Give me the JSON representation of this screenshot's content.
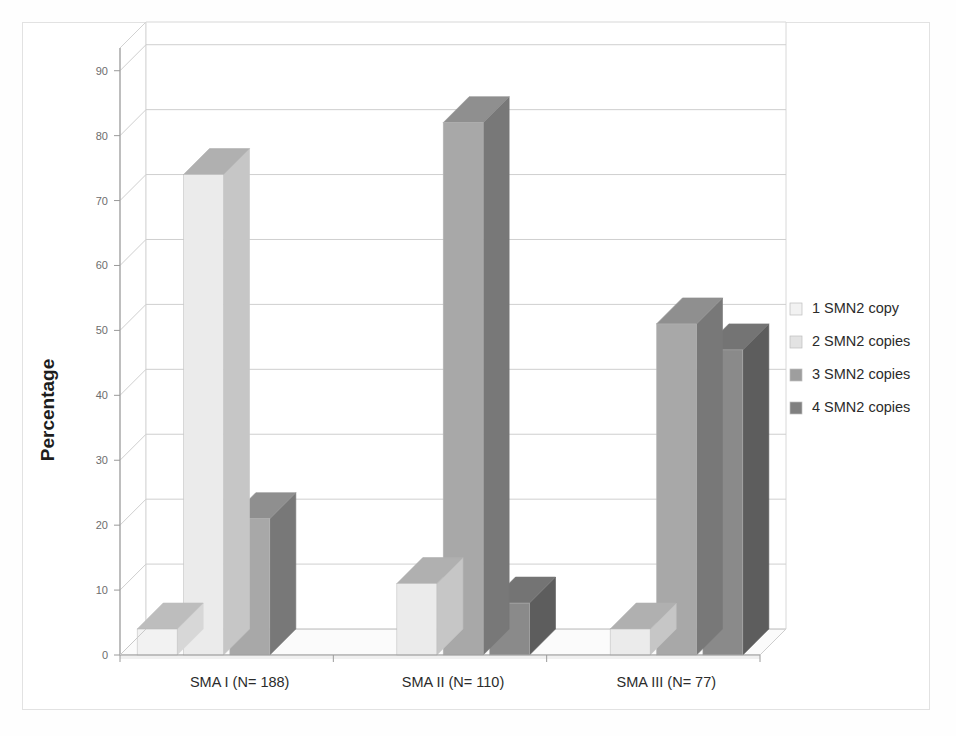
{
  "figure": {
    "background_color": "#ffffff",
    "frame_color": "#e2e2e2",
    "plot_background_color": "#ffffff"
  },
  "chart_data": {
    "type": "bar",
    "subtype": "grouped-3d-column",
    "title": "",
    "subtitle": "",
    "xlabel": "",
    "ylabel": "Percentage",
    "categories": [
      "SMA I (N= 188)",
      "SMA II (N= 110)",
      "SMA III (N= 77)"
    ],
    "series": [
      {
        "name": "1 SMN2 copy",
        "color": "#f2f2f2",
        "side_color": "#d7d7d7",
        "top_color": "#bdbdbd",
        "values": [
          4,
          0,
          0
        ]
      },
      {
        "name": "2 SMN2 copies",
        "color": "#ebebeb",
        "side_color": "#c6c6c6",
        "top_color": "#b0b0b0",
        "values": [
          74,
          11,
          4
        ]
      },
      {
        "name": "3 SMN2 copies",
        "color": "#a8a8a8",
        "side_color": "#787878",
        "top_color": "#8f8f8f",
        "values": [
          21,
          82,
          51
        ]
      },
      {
        "name": "4 SMN2 copies",
        "color": "#8a8a8a",
        "side_color": "#5d5d5d",
        "top_color": "#747474",
        "values": [
          0,
          8,
          47
        ]
      }
    ],
    "ylim": [
      0,
      90
    ],
    "yticks": [
      0,
      10,
      20,
      30,
      40,
      50,
      60,
      70,
      80,
      90
    ],
    "ytick_labels": [
      "0",
      "10",
      "20",
      "30",
      "40",
      "50",
      "60",
      "70",
      "80",
      "90"
    ],
    "grid": true,
    "grid_axis": "y",
    "legend": {
      "position": "right",
      "entries": [
        "1 SMN2 copy",
        "2 SMN2 copies",
        "3 SMN2 copies",
        "4 SMN2 copies"
      ]
    }
  },
  "axis": {
    "y_title": "Percentage",
    "y_tick_labels": [
      "90",
      "80",
      "70",
      "60",
      "50",
      "40",
      "30",
      "20",
      "10",
      "0"
    ],
    "x_tick_labels": [
      "SMA I (N= 188)",
      "SMA II (N= 110)",
      "SMA III (N= 77)"
    ]
  },
  "legend": {
    "items": [
      {
        "label": "1 SMN2 copy",
        "swatch": "#f2f2f2"
      },
      {
        "label": "2 SMN2 copies",
        "swatch": "#e3e3e3"
      },
      {
        "label": "3 SMN2 copies",
        "swatch": "#9e9e9e"
      },
      {
        "label": "4 SMN2 copies",
        "swatch": "#808080"
      }
    ]
  }
}
